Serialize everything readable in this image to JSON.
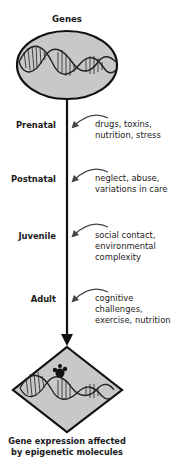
{
  "diagram": {
    "top_label": "Genes",
    "stages": [
      {
        "label": "Prenatal",
        "factors": "drugs, toxins,\nnutrition, stress"
      },
      {
        "label": "Postnatal",
        "factors": "neglect, abuse,\nvariations in care"
      },
      {
        "label": "Juvenile",
        "factors": "social contact,\nenvironmental\ncomplexity"
      },
      {
        "label": "Adult",
        "factors": "cognitive\nchallenges,\nexercise, nutrition"
      }
    ],
    "bottom_caption": "Gene expression affected\nby epigenetic molecules",
    "colors": {
      "shape_fill": "#c8c8c8",
      "stroke": "#111111",
      "arrow_gray": "#444444"
    }
  }
}
